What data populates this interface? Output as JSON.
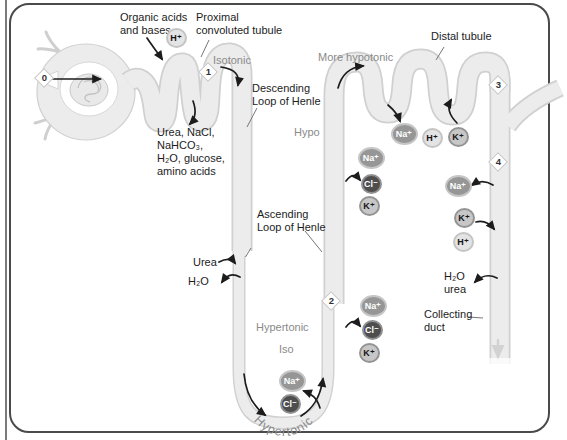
{
  "labels": {
    "organic_acids": "Organic acids\nand bases,",
    "proximal_tubule": "Proximal\nconvoluted tubule",
    "isotonic": "Isotonic",
    "descending_loop": "Descending\nLoop of Henle",
    "filtrate": "Urea, NaCl,\nNaHCO₃,\nH₂O, glucose,\namino acids",
    "urea": "Urea",
    "h2o": "H₂O",
    "ascending_loop": "Ascending\nLoop of Henle",
    "hypertonic": "Hypertonic",
    "iso": "Iso",
    "hypertonic_bend": "Hypertonic",
    "hypo": "Hypo",
    "more_hypotonic": "More hypotonic",
    "distal_tubule": "Distal tubule",
    "h2o_urea": "H₂O\nurea",
    "collecting_duct": "Collecting\nduct"
  },
  "markers": [
    "0",
    "1",
    "2",
    "3",
    "4"
  ],
  "ions": {
    "na": "Na⁺",
    "cl": "Cl⁻",
    "k": "K⁺",
    "h": "H⁺"
  },
  "colors": {
    "tube_fill": "#ececec",
    "tube_line": "#d0d0d0",
    "ink": "#1c1c1c",
    "gray_text": "#8a8a8a",
    "na": "#969696",
    "cl": "#4e4e4e",
    "k": "#c7c7c7",
    "h": "#e4e4e4",
    "frame": "#4a4a4a"
  }
}
